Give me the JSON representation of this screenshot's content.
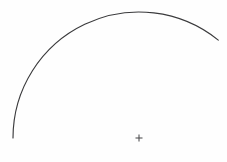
{
  "figure": {
    "background_color": "#fefefe",
    "width": 227,
    "height": 162,
    "stroke_color": "#3a3a3c",
    "mark_color": "#4a4a4c"
  },
  "chart_data": {
    "type": "line",
    "title": "",
    "subtitle": "",
    "xlabel": "",
    "ylabel": "",
    "grid": false,
    "legend": null,
    "axis_visible": false,
    "tick_labels": [],
    "annotations": [],
    "xlim": [
      0,
      227
    ],
    "ylim": [
      0,
      162
    ],
    "series": [
      {
        "name": "arc",
        "shape": "circular-arc",
        "center_x": 139,
        "center_y": 138,
        "radius": 126,
        "start_angle_deg": 180,
        "end_angle_deg": 309,
        "sweep_deg": 129,
        "stroke_color": "#3a3a3c",
        "stroke_width": 1.15,
        "x": [
          13,
          15,
          19,
          25,
          34,
          46,
          60,
          76,
          94,
          113,
          126,
          140,
          155,
          172,
          189,
          204,
          214
        ],
        "y": [
          138,
          121,
          104,
          88,
          73,
          59,
          46,
          35,
          26,
          18,
          15,
          12,
          12,
          15,
          20,
          28,
          36
        ]
      },
      {
        "name": "center-cross",
        "shape": "plus-marker",
        "center_x": 139,
        "center_y": 138,
        "size": 7,
        "stroke_color": "#4a4a4c",
        "stroke_width": 1.05
      }
    ]
  },
  "elements": {
    "arc_name": "arc-curve",
    "cross_name": "center-cross-marker"
  }
}
